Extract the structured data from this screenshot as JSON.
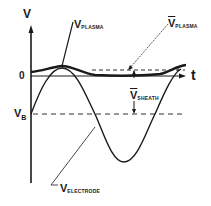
{
  "diagram": {
    "axes": {
      "y_label": "V",
      "x_label": "t",
      "zero_label": "0",
      "bias_label_main": "V",
      "bias_label_sub": "B"
    },
    "curves": [
      {
        "name": "V_plasma",
        "main": "V",
        "sub": "PLASMA",
        "style": "thick solid"
      },
      {
        "name": "V_electrode",
        "main": "V",
        "sub": "ELECTRODE",
        "style": "solid sinusoid"
      }
    ],
    "annotations": [
      {
        "name": "mean_plasma_potential",
        "main": "V",
        "sub": "PLASMA",
        "overbar": true,
        "style": "dashed line"
      },
      {
        "name": "mean_sheath_voltage",
        "main": "V",
        "sub": "SHEATH",
        "overbar": true,
        "style": "vertical arrow"
      }
    ],
    "colors": {
      "ink": "#1a1a1a",
      "background": "#ffffff"
    }
  }
}
